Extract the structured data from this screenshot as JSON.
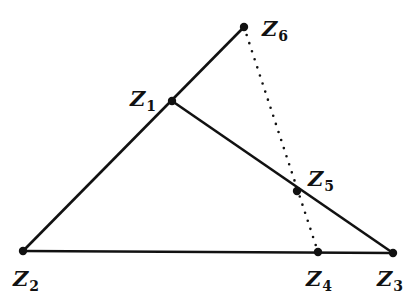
{
  "diagram": {
    "colors": {
      "stroke": "#111111",
      "background": "#ffffff"
    },
    "points": [
      {
        "id": "Z1",
        "base": "Z",
        "sub": "1",
        "x": 172,
        "y": 101,
        "lx": 130,
        "ly": 106
      },
      {
        "id": "Z2",
        "base": "Z",
        "sub": "2",
        "x": 23,
        "y": 251,
        "lx": 13,
        "ly": 286
      },
      {
        "id": "Z3",
        "base": "Z",
        "sub": "3",
        "x": 393,
        "y": 253,
        "lx": 377,
        "ly": 286
      },
      {
        "id": "Z4",
        "base": "Z",
        "sub": "4",
        "x": 318,
        "y": 252,
        "lx": 306,
        "ly": 286
      },
      {
        "id": "Z5",
        "base": "Z",
        "sub": "5",
        "x": 297,
        "y": 191,
        "lx": 308,
        "ly": 186
      },
      {
        "id": "Z6",
        "base": "Z",
        "sub": "6",
        "x": 244,
        "y": 27,
        "lx": 262,
        "ly": 36
      }
    ],
    "segments": [
      {
        "from": "Z2",
        "to": "Z6",
        "style": "solid"
      },
      {
        "from": "Z2",
        "to": "Z3",
        "style": "solid"
      },
      {
        "from": "Z1",
        "to": "Z3",
        "style": "solid"
      },
      {
        "from": "Z6",
        "to": "Z4",
        "style": "dotted"
      }
    ]
  }
}
